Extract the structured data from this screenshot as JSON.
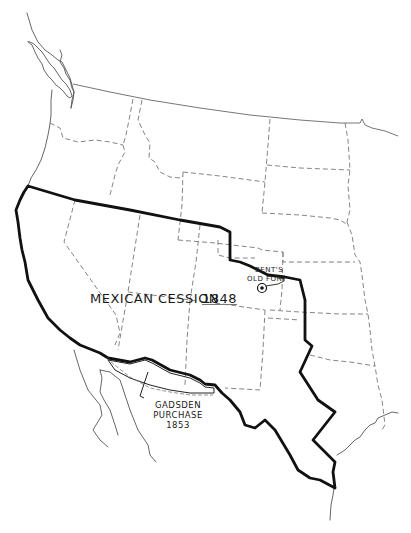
{
  "map": {
    "title": "Mexican Cession 1848",
    "labels": {
      "cession_name": "MEXICAN CESSION",
      "cession_year": "1848",
      "fort_line1": "BENT'S",
      "fort_line2": "OLD FORT",
      "gadsden_line1": "GADSDEN",
      "gadsden_line2": "PURCHASE",
      "gadsden_line3": "1853"
    },
    "features": [
      {
        "name": "Mexican Cession boundary",
        "style": "heavy black line"
      },
      {
        "name": "Gadsden Purchase outline",
        "style": "double line with dashes"
      },
      {
        "name": "State boundaries",
        "style": "dashed gray lines"
      },
      {
        "name": "Canada-US border",
        "style": "thin gray line"
      },
      {
        "name": "Pacific coastline",
        "style": "thin gray line"
      },
      {
        "name": "Gulf coast",
        "style": "thin gray line"
      },
      {
        "name": "Baja California / Gulf of California",
        "style": "thin gray line"
      },
      {
        "name": "Bent's Old Fort marker",
        "style": "circled dot"
      }
    ],
    "colors": {
      "background": "#ffffff",
      "boundary": "#111111",
      "state_lines": "#777777"
    }
  }
}
